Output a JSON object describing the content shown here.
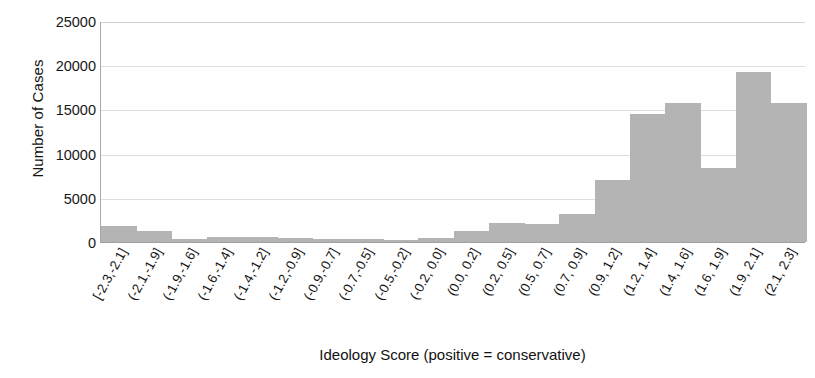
{
  "chart_data": {
    "type": "bar",
    "title": "",
    "xlabel": "Ideology Score (positive = conservative)",
    "ylabel": "Number of Cases",
    "categories": [
      "[-2.3,-2.1]",
      "(-2.1,-1.9]",
      "(-1.9,-1.6]",
      "(-1.6,-1.4]",
      "(-1.4,-1.2]",
      "(-1.2,-0.9]",
      "(-0.9,-0.7]",
      "(-0.7,-0.5]",
      "(-0.5,-0.2]",
      "(-0.2, 0.0]",
      "(0.0, 0.2]",
      "(0.2, 0.5]",
      "(0.5, 0.7]",
      "(0.7, 0.9]",
      "(0.9, 1.2]",
      "(1.2, 1.4]",
      "(1.4, 1.6]",
      "(1.6, 1.9]",
      "(1.9, 2.1]",
      "(2.1, 2.3]"
    ],
    "values": [
      1800,
      1200,
      300,
      600,
      600,
      400,
      300,
      300,
      200,
      400,
      1200,
      2200,
      2000,
      3200,
      7000,
      14500,
      15700,
      8400,
      19200,
      15700
    ],
    "ylim": [
      0,
      25000
    ],
    "yticks": [
      0,
      5000,
      10000,
      15000,
      20000,
      25000
    ],
    "ytick_labels": [
      "0",
      "5000",
      "10000",
      "15000",
      "20000",
      "25000"
    ],
    "grid": true,
    "legend": false,
    "bar_color": "#b4b4b4",
    "grid_color": "#dedede",
    "axis_color": "#a8a8a8"
  }
}
